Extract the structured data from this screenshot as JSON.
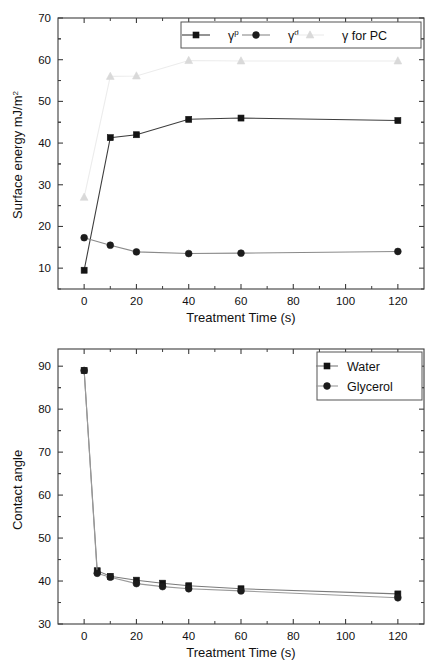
{
  "figure": {
    "background": "#ffffff",
    "panel_count": 2
  },
  "chart_data": [
    {
      "id": "surface-energy",
      "type": "line",
      "title": "",
      "xlabel": "Treatment Time (s)",
      "ylabel": "Surface energy mJ/m",
      "ylabel_sup": "2",
      "x": [
        0,
        10,
        20,
        40,
        60,
        120
      ],
      "xlim": [
        -10,
        130
      ],
      "ylim": [
        5,
        70
      ],
      "xticks": [
        0,
        20,
        40,
        60,
        80,
        100,
        120
      ],
      "xticklabels": [
        "0",
        "20",
        "40",
        "60",
        "80",
        "100",
        "120"
      ],
      "yticks": [
        10,
        20,
        30,
        40,
        50,
        60,
        70
      ],
      "yticklabels": [
        "10",
        "20",
        "30",
        "40",
        "50",
        "60",
        "70"
      ],
      "grid": false,
      "legend_position": "top-right",
      "series": [
        {
          "name": "gamma-p",
          "label": "γ",
          "label_sup": "p",
          "marker": "square",
          "color": "#141414",
          "line_color": "#3d3d3d",
          "x": [
            0,
            10,
            20,
            40,
            60,
            120
          ],
          "values": [
            9.5,
            41.3,
            42.0,
            45.7,
            46.0,
            45.4
          ]
        },
        {
          "name": "gamma-d",
          "label": "γ",
          "label_sup": "d",
          "marker": "circle",
          "color": "#1c1c1c",
          "line_color": "#8a8a8a",
          "x": [
            0,
            10,
            20,
            40,
            60,
            120
          ],
          "values": [
            17.3,
            15.5,
            13.9,
            13.5,
            13.6,
            14.0
          ]
        },
        {
          "name": "gamma-for-pc",
          "label": "γ for PC",
          "label_sup": "",
          "marker": "triangle",
          "color": "#d9d9d9",
          "line_color": "#ececec",
          "x": [
            0,
            10,
            20,
            40,
            60,
            120
          ],
          "values": [
            27.0,
            56.0,
            56.1,
            59.8,
            59.7,
            59.7
          ]
        }
      ]
    },
    {
      "id": "contact-angle",
      "type": "line",
      "title": "",
      "xlabel": "Treatment Time (s)",
      "ylabel": "Contact angle",
      "ylabel_sup": "",
      "x": [
        0,
        5,
        10,
        20,
        30,
        40,
        60,
        120
      ],
      "xlim": [
        -10,
        130
      ],
      "ylim": [
        30,
        94
      ],
      "xticks": [
        0,
        20,
        40,
        60,
        80,
        100,
        120
      ],
      "xticklabels": [
        "0",
        "20",
        "40",
        "60",
        "80",
        "100",
        "120"
      ],
      "yticks": [
        30,
        40,
        50,
        60,
        70,
        80,
        90
      ],
      "yticklabels": [
        "30",
        "40",
        "50",
        "60",
        "70",
        "80",
        "90"
      ],
      "grid": false,
      "legend_position": "top-right",
      "series": [
        {
          "name": "water",
          "label": "Water",
          "label_sup": "",
          "marker": "square",
          "color": "#141414",
          "line_color": "#7a7a7a",
          "x": [
            0,
            5,
            10,
            20,
            30,
            40,
            60,
            120
          ],
          "values": [
            89.0,
            42.4,
            41.1,
            40.2,
            39.5,
            38.9,
            38.2,
            37.0
          ]
        },
        {
          "name": "glycerol",
          "label": "Glycerol",
          "label_sup": "",
          "marker": "circle",
          "color": "#1c1c1c",
          "line_color": "#9a9a9a",
          "x": [
            0,
            5,
            10,
            20,
            30,
            40,
            60,
            120
          ],
          "values": [
            89.0,
            41.8,
            40.9,
            39.4,
            38.7,
            38.2,
            37.7,
            36.1
          ]
        }
      ]
    }
  ]
}
